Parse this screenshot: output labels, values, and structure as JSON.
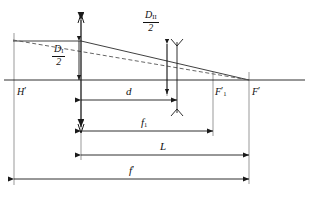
{
  "diagram": {
    "type": "optical-ray-diagram",
    "colors": {
      "line": "#1a1a1a",
      "ray_solid": "#2a2a2a",
      "ray_dashed": "#555555",
      "axis": "#1a1a1a",
      "background": "#ffffff"
    },
    "axis": {
      "name": "optical-axis",
      "y": 80,
      "x_start": 4,
      "x_end": 305
    },
    "points": [
      {
        "id": "H",
        "label": "H",
        "prime": "′",
        "x": 17,
        "y": 92
      },
      {
        "id": "F1",
        "label": "F",
        "prime": "′",
        "sub": "1",
        "x": 213,
        "y": 92
      },
      {
        "id": "F",
        "label": "F",
        "prime": "′",
        "x": 249,
        "y": 92
      }
    ],
    "elements": [
      {
        "id": "lens-1",
        "name": "first-lens-element",
        "x": 81,
        "y_top": 14,
        "y_bottom": 133,
        "style": "double-arrow-thin-lens"
      },
      {
        "id": "lens-2",
        "name": "second-lens-element",
        "x": 177,
        "y_top": 39,
        "y_bottom": 116,
        "style": "biconcave-thin-lens"
      }
    ],
    "rays": [
      {
        "id": "ray-solid",
        "name": "marginal-ray-solid",
        "style": "solid",
        "points": "13,41 81,41 249,80"
      },
      {
        "id": "ray-dashed",
        "name": "equivalent-ray-dashed",
        "style": "dashed",
        "points": "13,40 249,80"
      }
    ],
    "height_labels": [
      {
        "id": "D1",
        "name": "semi-aperture-first-lens",
        "numerator": "D",
        "subscript": "I",
        "denominator": "2",
        "x": 57,
        "y": 48,
        "arrow_x": 79,
        "arrow_top": 41,
        "arrow_bottom": 80
      },
      {
        "id": "D2",
        "name": "semi-aperture-second-lens",
        "numerator": "D",
        "subscript": "II",
        "denominator": "2",
        "x": 148,
        "y": 14,
        "arrow_x": 167,
        "arrow_top": 40,
        "arrow_bottom": 88
      }
    ],
    "dimensions": [
      {
        "id": "d",
        "name": "lens-separation",
        "label": "d",
        "prime": "",
        "sub": "",
        "x_start": 81,
        "x_end": 177,
        "y": 100,
        "label_x": 127,
        "label_y": 88
      },
      {
        "id": "f1",
        "name": "first-lens-focal-length",
        "label": "f",
        "prime": "",
        "sub": "1",
        "x_start": 81,
        "x_end": 213,
        "y": 131,
        "label_x": 142,
        "label_y": 118
      },
      {
        "id": "L",
        "name": "back-focal-distance",
        "label": "L",
        "prime": "",
        "sub": "",
        "x_start": 81,
        "x_end": 249,
        "y": 155,
        "label_x": 160,
        "label_y": 142
      },
      {
        "id": "fprime",
        "name": "system-effective-focal-length",
        "label": "f",
        "prime": "′",
        "sub": "",
        "x_start": 14,
        "x_end": 249,
        "y": 179,
        "label_x": 130,
        "label_y": 166
      }
    ],
    "verticals": [
      {
        "name": "reference-line-H",
        "x": 14,
        "y_top": 33,
        "y_bottom": 185
      },
      {
        "name": "reference-line-lens1",
        "x": 81,
        "y_top": 14,
        "y_bottom": 160
      },
      {
        "name": "reference-line-F1",
        "x": 213,
        "y_top": 72,
        "y_bottom": 136
      },
      {
        "name": "reference-line-F",
        "x": 249,
        "y_top": 72,
        "y_bottom": 184
      }
    ]
  }
}
